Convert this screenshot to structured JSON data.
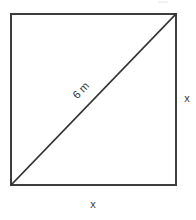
{
  "figure": {
    "background_color": "#ffffff",
    "stroke_color": "#3d3d3d",
    "diagonal_stroke_color": "#333333",
    "square": {
      "name": "square",
      "left": 11,
      "top": 14,
      "right": 176,
      "bottom": 185,
      "stroke_width": 2
    },
    "diagonal": {
      "name": "diagonal",
      "x1": 11,
      "y1": 185,
      "x2": 176,
      "y2": 14,
      "stroke_width": 1.6,
      "label": "6 m",
      "label_rotation_deg": -46
    },
    "labels": {
      "side_right": "x",
      "side_bottom": "x",
      "diagonal_length": "6 m"
    }
  }
}
